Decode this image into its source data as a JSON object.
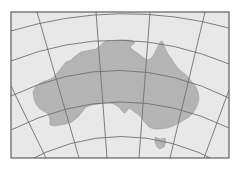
{
  "map": {
    "subject": "Australia",
    "projection_style": "conic graticule",
    "colors": {
      "background": "#ffffff",
      "ocean": "#e8e8e8",
      "land": "#b4b4b4",
      "land_outline": "#9a9a9a",
      "graticule": "#707070",
      "frame": "#5e5e5e"
    },
    "frame": {
      "x": 11,
      "y": 12,
      "width": 218,
      "height": 146
    },
    "features": [
      {
        "name": "mainland-australia",
        "type": "landmass"
      },
      {
        "name": "tasmania",
        "type": "island"
      }
    ],
    "graticule": {
      "meridians": 6,
      "parallels": 5
    }
  }
}
